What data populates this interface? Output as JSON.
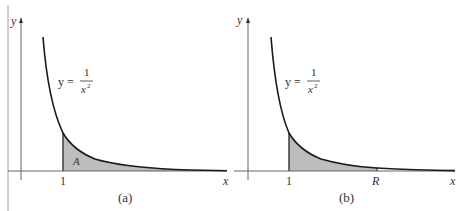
{
  "figure": {
    "panels": [
      {
        "id": "a",
        "caption": "(a)",
        "y_axis_label": "y",
        "x_axis_label": "x",
        "curve_label_lhs": "y =",
        "curve_label_num": "1",
        "curve_label_den": "x",
        "curve_label_exp": "2",
        "tick_1": "1",
        "area_label": "A"
      },
      {
        "id": "b",
        "caption": "(b)",
        "y_axis_label": "y",
        "x_axis_label": "x",
        "curve_label_lhs": "y =",
        "curve_label_num": "1",
        "curve_label_den": "x",
        "curve_label_exp": "2",
        "tick_1": "1",
        "tick_R": "R"
      }
    ],
    "colors": {
      "curve": "#1a1a1a",
      "axis": "#555555",
      "shade": "#bdbdbd"
    }
  }
}
